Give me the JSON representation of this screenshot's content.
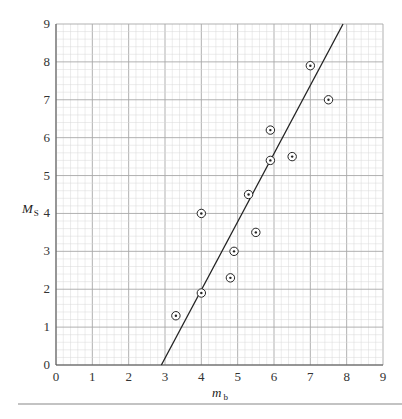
{
  "chart_data": {
    "type": "scatter",
    "title": "",
    "xlabel": "m_b",
    "xlabel_main": "m",
    "xlabel_sub": "b",
    "ylabel": "M_S",
    "ylabel_main": "M",
    "ylabel_sub": "S",
    "xlim": [
      0,
      9
    ],
    "ylim": [
      0,
      9
    ],
    "x_ticks": [
      "0",
      "1",
      "2",
      "3",
      "4",
      "5",
      "6",
      "7",
      "8",
      "9"
    ],
    "y_ticks": [
      "0",
      "1",
      "2",
      "3",
      "4",
      "5",
      "6",
      "7",
      "8",
      "9"
    ],
    "grid": true,
    "grid_minor_step": 0.2,
    "marker": "circled-dot",
    "points": [
      {
        "x": 3.3,
        "y": 1.3
      },
      {
        "x": 4.0,
        "y": 1.9
      },
      {
        "x": 4.0,
        "y": 4.0
      },
      {
        "x": 4.8,
        "y": 2.3
      },
      {
        "x": 4.9,
        "y": 3.0
      },
      {
        "x": 5.3,
        "y": 4.5
      },
      {
        "x": 5.5,
        "y": 3.5
      },
      {
        "x": 5.9,
        "y": 5.4
      },
      {
        "x": 5.9,
        "y": 6.2
      },
      {
        "x": 6.5,
        "y": 5.5
      },
      {
        "x": 7.0,
        "y": 7.9
      },
      {
        "x": 7.5,
        "y": 7.0
      }
    ],
    "fit_line": {
      "x1": 2.9,
      "y1": 0,
      "x2": 7.9,
      "y2": 9
    }
  },
  "colors": {
    "grid_minor": "#d9d9d9",
    "grid_major": "#a8a8a8",
    "ink": "#222222",
    "rule": "#888888"
  }
}
